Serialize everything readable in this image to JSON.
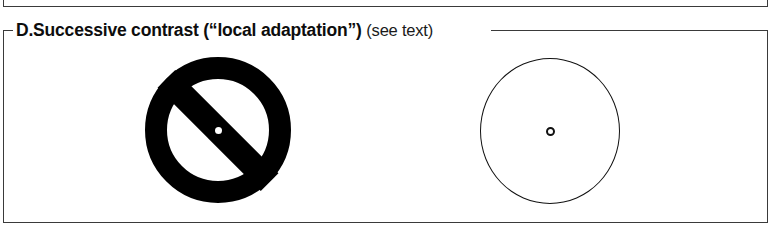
{
  "panel": {
    "id": "D.",
    "title": "Successive contrast (“local adaptation”)",
    "note": "(see text)"
  },
  "figures": {
    "left": {
      "name": "prohibition-sign",
      "description": "solid black annulus with diagonal bar, white center dot",
      "fill_color": "#000000",
      "center_dot_color": "#ffffff"
    },
    "right": {
      "name": "outline-circle",
      "description": "thin black outlined circle with small hollow fixation ring at center",
      "stroke_color": "#111111",
      "fill_color": "#ffffff"
    }
  },
  "style": {
    "border_color": "#3a3a3a",
    "background": "#ffffff",
    "text_color": "#0d0d0d"
  }
}
